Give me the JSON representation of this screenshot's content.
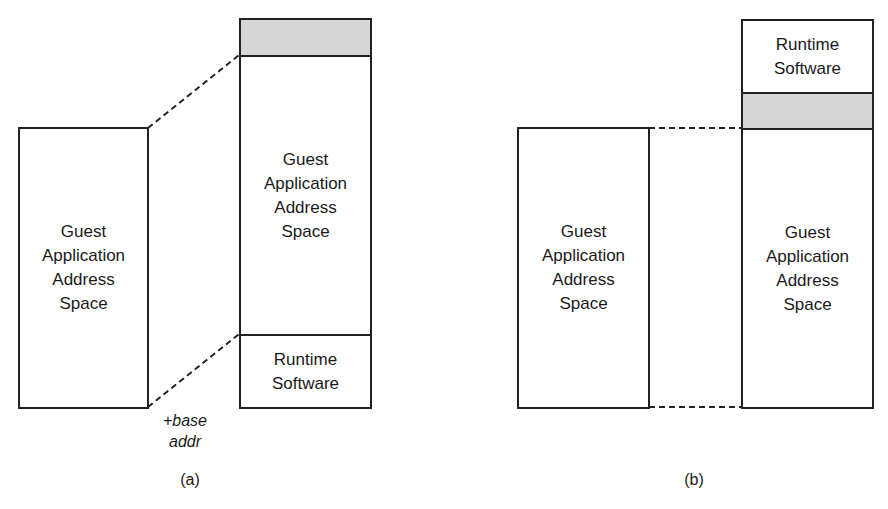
{
  "diagram_a": {
    "caption": "(a)",
    "guest_box": {
      "label": "Guest\nApplication\nAddress\nSpace"
    },
    "host_stack": [
      {
        "type": "reserved",
        "label": "",
        "fill": "#d6d6d6"
      },
      {
        "type": "guest",
        "label": "Guest\nApplication\nAddress\nSpace"
      },
      {
        "type": "runtime",
        "label": "Runtime\nSoftware"
      }
    ],
    "offset_label": "+base\naddr"
  },
  "diagram_b": {
    "caption": "(b)",
    "guest_box": {
      "label": "Guest\nApplication\nAddress\nSpace"
    },
    "host_stack": [
      {
        "type": "runtime",
        "label": "Runtime\nSoftware"
      },
      {
        "type": "reserved",
        "label": "",
        "fill": "#d6d6d6"
      },
      {
        "type": "guest",
        "label": "Guest\nApplication\nAddress\nSpace"
      }
    ]
  }
}
